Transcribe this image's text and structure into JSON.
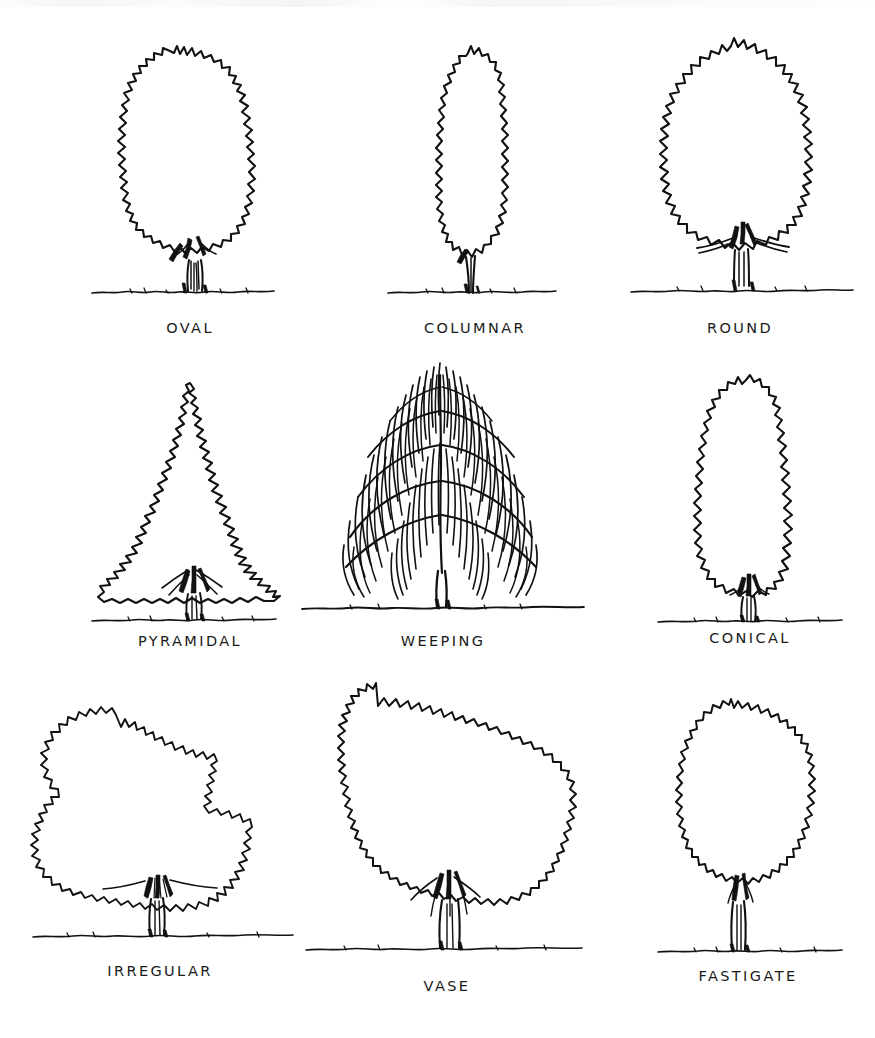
{
  "plate": {
    "title": "Tree Shapes",
    "description": "Hand-drawn plate of nine tree crown forms arranged in a three by three grid, each drawn in black ink line on white paper with a hand-lettered caption beneath.",
    "background_color": "#ffffff",
    "ink_color": "#111111",
    "columns": 3,
    "rows": 3,
    "total_figures": 9
  },
  "figures": [
    {
      "id": "oval",
      "label": "OVAL",
      "row": 1,
      "column": 1,
      "crown_shape": "oval",
      "crown_outline": "scalloped",
      "trunk": "short-multi-branch",
      "ground_line": true
    },
    {
      "id": "columnar",
      "label": "COLUMNAR",
      "row": 1,
      "column": 2,
      "crown_shape": "narrow-upright-column",
      "crown_outline": "scalloped",
      "trunk": "slender-single",
      "ground_line": true
    },
    {
      "id": "round",
      "label": "ROUND",
      "row": 1,
      "column": 3,
      "crown_shape": "circular",
      "crown_outline": "scalloped",
      "trunk": "short-spreading-branch",
      "ground_line": true
    },
    {
      "id": "pyramidal",
      "label": "PYRAMIDAL",
      "row": 2,
      "column": 1,
      "crown_shape": "triangular-pointed-apex",
      "crown_outline": "scalloped",
      "trunk": "short-multi-branch",
      "ground_line": true
    },
    {
      "id": "weeping",
      "label": "WEEPING",
      "row": 2,
      "column": 2,
      "crown_shape": "dome-with-hanging-strands",
      "crown_outline": "dense-drooping-strokes",
      "trunk": "slender-single-with-arching-branches",
      "ground_line": true
    },
    {
      "id": "conical",
      "label": "CONICAL",
      "row": 2,
      "column": 3,
      "crown_shape": "teardrop-cone",
      "crown_outline": "scalloped",
      "trunk": "short-multi-branch",
      "ground_line": true
    },
    {
      "id": "irregular",
      "label": "IRREGULAR",
      "row": 3,
      "column": 1,
      "crown_shape": "asymmetric-lobed",
      "crown_outline": "deeply-irregular",
      "trunk": "short-fan-branch",
      "ground_line": true
    },
    {
      "id": "vase",
      "label": "VASE",
      "row": 3,
      "column": 2,
      "crown_shape": "inverted-triangle-fan",
      "crown_outline": "scalloped",
      "trunk": "tall-vase-branch",
      "ground_line": true
    },
    {
      "id": "fastigate",
      "label": "FASTIGATE",
      "row": 3,
      "column": 3,
      "crown_shape": "narrow-upright-wide-top",
      "crown_outline": "scalloped",
      "trunk": "slender-upright",
      "ground_line": true
    }
  ]
}
